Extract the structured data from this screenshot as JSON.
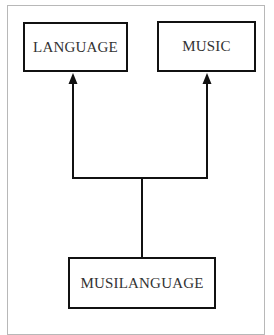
{
  "diagram": {
    "type": "hierarchy",
    "nodes": [
      {
        "id": "language",
        "label": "LANGUAGE"
      },
      {
        "id": "music",
        "label": "MUSIC"
      },
      {
        "id": "musilanguage",
        "label": "MUSILANGUAGE"
      }
    ],
    "edges": [
      {
        "from": "musilanguage",
        "to": "language",
        "style": "arrow"
      },
      {
        "from": "musilanguage",
        "to": "music",
        "style": "arrow"
      }
    ],
    "colors": {
      "stroke": "#111111",
      "text": "#333333",
      "frame": "#b8b8b8",
      "background": "#ffffff"
    }
  }
}
